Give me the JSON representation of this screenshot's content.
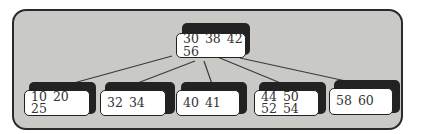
{
  "diagram": {
    "type": "b-tree",
    "root": {
      "keys": "30 38 42 56"
    },
    "children": [
      {
        "keys": "10 20 25"
      },
      {
        "keys": "32 34"
      },
      {
        "keys": "40 41"
      },
      {
        "keys": "44 50 52 54"
      },
      {
        "keys": "58 60"
      }
    ]
  },
  "colors": {
    "panel": "#c9c9c6",
    "box": "#ffffff",
    "shadow": "#222222",
    "line": "#333333"
  }
}
